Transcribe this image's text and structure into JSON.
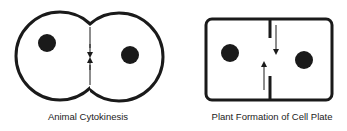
{
  "colors": {
    "stroke": "#1a1a1a",
    "background": "#ffffff",
    "text": "#222222"
  },
  "panels": [
    {
      "id": "animal",
      "caption": "Animal Cytokinesis",
      "shape": "two-overlapping-circles",
      "nuclei": 2,
      "arrows": [
        "down",
        "up"
      ]
    },
    {
      "id": "plant",
      "caption": "Plant Formation of Cell Plate",
      "shape": "rounded-rectangle",
      "nuclei": 2,
      "arrows": [
        "down",
        "up"
      ]
    }
  ]
}
